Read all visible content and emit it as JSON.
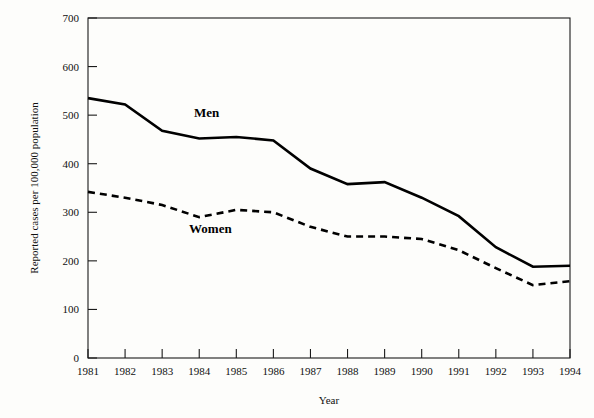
{
  "chart_data": {
    "type": "line",
    "title": "",
    "subtitle": "",
    "xlabel": "Year",
    "ylabel": "Reported cases per 100,000 population",
    "categories": [
      "1981",
      "1982",
      "1983",
      "1984",
      "1985",
      "1986",
      "1987",
      "1988",
      "1989",
      "1990",
      "1991",
      "1992",
      "1993",
      "1994"
    ],
    "x": [
      1981,
      1982,
      1983,
      1984,
      1985,
      1986,
      1987,
      1988,
      1989,
      1990,
      1991,
      1992,
      1993,
      1994
    ],
    "series": [
      {
        "name": "Men",
        "style": "solid",
        "color": "#000000",
        "values": [
          535,
          522,
          468,
          452,
          455,
          448,
          390,
          358,
          362,
          330,
          292,
          228,
          188,
          190
        ]
      },
      {
        "name": "Women",
        "style": "dashed",
        "color": "#000000",
        "values": [
          342,
          330,
          315,
          290,
          305,
          300,
          270,
          250,
          250,
          245,
          222,
          185,
          150,
          158
        ]
      }
    ],
    "ylim": [
      0,
      700
    ],
    "yticks": [
      0,
      100,
      200,
      300,
      400,
      500,
      600,
      700
    ],
    "ytick_labels": [
      "0",
      "100",
      "200",
      "300",
      "400",
      "500",
      "600",
      "700"
    ],
    "xlim": [
      1981,
      1994
    ],
    "grid": false,
    "legend_position": "inline-annotations",
    "annotations": [
      {
        "text": "Men",
        "x": 1984.2,
        "y": 497
      },
      {
        "text": "Women",
        "x": 1984.3,
        "y": 258
      }
    ]
  },
  "axis": {
    "y_title": "Reported cases per 100,000 population",
    "x_title": "Year"
  },
  "labels": {
    "men": "Men",
    "women": "Women"
  }
}
